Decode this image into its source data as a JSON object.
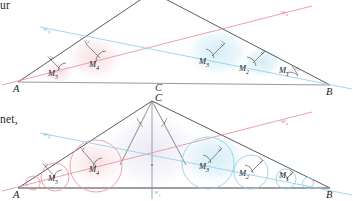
{
  "figure": {
    "kind": "geometry-diagram",
    "margin_text": [
      {
        "id": "frag-top",
        "text": "ur"
      },
      {
        "id": "frag-bottom",
        "text": "net,"
      }
    ],
    "panels": [
      {
        "id": "upper",
        "vertices": [
          {
            "name": "A",
            "label": "A",
            "x": 18,
            "y": 82
          },
          {
            "name": "B",
            "label": "B",
            "x": 330,
            "y": 85
          },
          {
            "name": "C",
            "label": "C",
            "x": 152,
            "y": -8
          }
        ],
        "bisector_lines": [
          {
            "name": "w-alpha",
            "label": "w",
            "sub": "α",
            "color": "#e8909e",
            "label_x": 283,
            "label_y": 12
          },
          {
            "name": "w-beta",
            "label": "w",
            "sub": "β",
            "color": "#8fd0e6",
            "label_x": 46,
            "label_y": 28
          }
        ],
        "centers": [
          {
            "label": "M",
            "sub": "1",
            "lx": 283,
            "ly": 70
          },
          {
            "label": "M",
            "sub": "2",
            "lx": 243,
            "ly": 68
          },
          {
            "label": "M",
            "sub": "3",
            "lx": 203,
            "ly": 62
          },
          {
            "label": "M",
            "sub": "4",
            "lx": 93,
            "ly": 65
          },
          {
            "label": "M",
            "sub": "5",
            "lx": 52,
            "ly": 74
          }
        ],
        "partial_C_label": {
          "label": "C",
          "x": 157,
          "y": 88
        }
      },
      {
        "id": "lower",
        "vertices": [
          {
            "name": "A",
            "label": "A",
            "x": 18,
            "y": 188
          },
          {
            "name": "B",
            "label": "B",
            "x": 330,
            "y": 188
          },
          {
            "name": "C",
            "label": "C",
            "x": 152,
            "y": 101
          }
        ],
        "bisector_lines": [
          {
            "name": "w-alpha",
            "label": "w",
            "sub": "α",
            "color": "#e8909e",
            "label_x": 283,
            "label_y": 121
          },
          {
            "name": "w-beta",
            "label": "w",
            "sub": "β",
            "color": "#8fd0e6",
            "label_x": 46,
            "label_y": 133
          },
          {
            "name": "w-gamma",
            "label": "w",
            "sub": "γ",
            "color": "#8fd0e6",
            "label_x": 155,
            "label_y": 190
          }
        ],
        "centers": [
          {
            "label": "M",
            "sub": "1",
            "lx": 283,
            "ly": 175
          },
          {
            "label": "M",
            "sub": "2",
            "lx": 243,
            "ly": 173
          },
          {
            "label": "M",
            "sub": "3",
            "lx": 203,
            "ly": 167
          },
          {
            "label": "M",
            "sub": "4",
            "lx": 93,
            "ly": 170
          },
          {
            "label": "M",
            "sub": "5",
            "lx": 52,
            "ly": 179
          }
        ]
      }
    ],
    "colors": {
      "triangle_stroke": "#4a4a4a",
      "baseline_stroke": "#8a8a8a",
      "red_accent": "#e8909e",
      "blue_accent": "#8fd0e6",
      "red_fill": "#f6dfe4",
      "blue_fill": "#dbeff6",
      "text": "#1a1a1a",
      "background": "#ffffff"
    }
  }
}
